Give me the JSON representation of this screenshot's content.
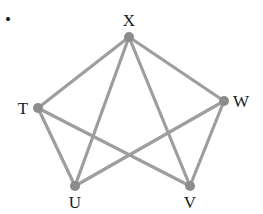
{
  "diagram": {
    "type": "graph",
    "bullet": "•",
    "colors": {
      "edge": "#9e9e9e",
      "node": "#8c8c8c",
      "label": "#1a1a1a"
    },
    "nodes": [
      {
        "id": "X",
        "label": "X",
        "x": 129,
        "y": 37,
        "lx": 129,
        "ly": 26
      },
      {
        "id": "T",
        "label": "T",
        "x": 38,
        "y": 108,
        "lx": 23,
        "ly": 114
      },
      {
        "id": "W",
        "label": "W",
        "x": 224,
        "y": 101,
        "lx": 241,
        "ly": 107
      },
      {
        "id": "U",
        "label": "U",
        "x": 75,
        "y": 186,
        "lx": 75,
        "ly": 208
      },
      {
        "id": "V",
        "label": "V",
        "x": 190,
        "y": 186,
        "lx": 190,
        "ly": 208
      }
    ],
    "edges": [
      [
        "X",
        "T"
      ],
      [
        "X",
        "W"
      ],
      [
        "X",
        "U"
      ],
      [
        "X",
        "V"
      ],
      [
        "T",
        "U"
      ],
      [
        "T",
        "V"
      ],
      [
        "W",
        "U"
      ],
      [
        "W",
        "V"
      ]
    ]
  }
}
